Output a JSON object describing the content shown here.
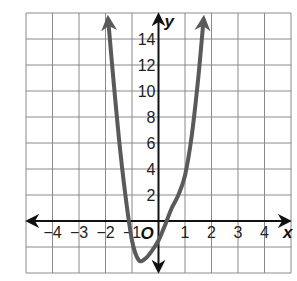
{
  "chart_data": {
    "type": "line",
    "title": "",
    "xlabel": "x",
    "ylabel": "y",
    "origin_label": "O",
    "xlim": [
      -5,
      5
    ],
    "ylim": [
      -4,
      16
    ],
    "grid": true,
    "x_ticks": [
      -4,
      -3,
      -2,
      -1,
      1,
      2,
      3,
      4
    ],
    "x_tick_labels": [
      "−4",
      "−3",
      "−2",
      "−1",
      "1",
      "2",
      "3",
      "4"
    ],
    "y_ticks": [
      2,
      4,
      6,
      8,
      10,
      12,
      14
    ],
    "y_tick_labels": [
      "2",
      "4",
      "6",
      "8",
      "10",
      "12",
      "14"
    ],
    "series": [
      {
        "name": "curve",
        "color": "#5a5a5a",
        "x": [
          -1.9,
          -1.75,
          -1.5,
          -1.25,
          -1.0,
          -0.75,
          -0.5,
          -0.25,
          0,
          0.25,
          0.5,
          0.75,
          1.0,
          1.25,
          1.5,
          1.7
        ],
        "y": [
          15.5,
          12.0,
          6.5,
          2.0,
          -1.5,
          -3.0,
          -2.9,
          -2.3,
          -1.5,
          -0.3,
          1.0,
          2.0,
          3.5,
          6.5,
          11.0,
          15.5
        ],
        "arrows_at_ends": true
      }
    ],
    "key_features": {
      "minimum": [
        -0.8,
        -3
      ],
      "x_intercepts": [
        -1.5,
        0.3
      ],
      "y_intercept": -1.5
    }
  }
}
